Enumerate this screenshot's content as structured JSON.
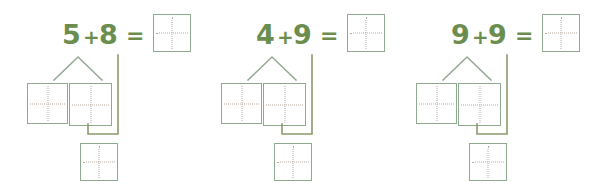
{
  "worksheet": {
    "title": "Make-a-ten addition worksheet",
    "background_color": "#ffffff",
    "digit_color": "#6b8e4e",
    "box_border_color": "#8faa8f",
    "guide_line_color": "#b9a9a0",
    "connector_color": "#8a9a6a",
    "problems": [
      {
        "id": "problem-1",
        "addend_a": "5",
        "operator": "+",
        "addend_b": "8",
        "equals": "=",
        "answer_value": "",
        "part_left_value": "",
        "part_right_value": "",
        "sum_value": ""
      },
      {
        "id": "problem-2",
        "addend_a": "4",
        "operator": "+",
        "addend_b": "9",
        "equals": "=",
        "answer_value": "",
        "part_left_value": "",
        "part_right_value": "",
        "sum_value": ""
      },
      {
        "id": "problem-3",
        "addend_a": "9",
        "operator": "+",
        "addend_b": "9",
        "equals": "=",
        "answer_value": "",
        "part_left_value": "",
        "part_right_value": "",
        "sum_value": ""
      }
    ]
  }
}
